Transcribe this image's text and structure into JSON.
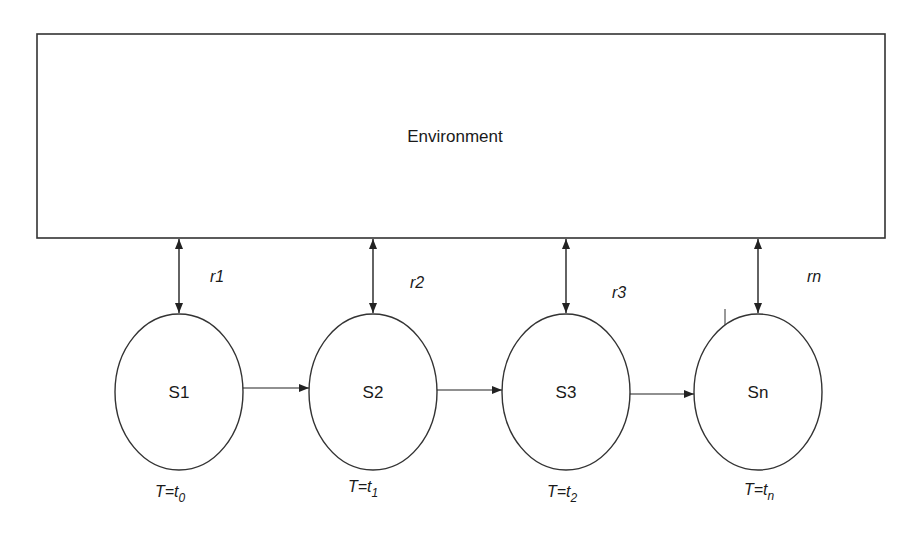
{
  "diagram": {
    "environment": {
      "label": "Environment",
      "x": 37,
      "y": 34,
      "w": 848,
      "h": 204
    },
    "stroke_color": "#333333",
    "states": [
      {
        "id": "S1",
        "label": "S1",
        "cx": 179,
        "cy": 392,
        "rx": 64,
        "ry": 78,
        "reward": "r1",
        "time_prefix": "T=t",
        "time_sub": "0",
        "reward_x": 210,
        "reward_y": 282,
        "time_x": 155,
        "time_y": 497
      },
      {
        "id": "S2",
        "label": "S2",
        "cx": 373,
        "cy": 392,
        "rx": 64,
        "ry": 78,
        "reward": "r2",
        "time_prefix": "T=t",
        "time_sub": "1",
        "reward_x": 410,
        "reward_y": 288,
        "time_x": 348,
        "time_y": 492
      },
      {
        "id": "S3",
        "label": "S3",
        "cx": 566,
        "cy": 392,
        "rx": 64,
        "ry": 78,
        "reward": "r3",
        "time_prefix": "T=t",
        "time_sub": "2",
        "reward_x": 612,
        "reward_y": 298,
        "time_x": 547,
        "time_y": 497
      },
      {
        "id": "Sn",
        "label": "Sn",
        "cx": 758,
        "cy": 392,
        "rx": 64,
        "ry": 78,
        "reward": "rn",
        "time_prefix": "T=t",
        "time_sub": "n",
        "reward_x": 807,
        "reward_y": 282,
        "time_x": 744,
        "time_y": 495
      }
    ],
    "transitions": [
      {
        "from": "S1",
        "to": "S2",
        "y": 388
      },
      {
        "from": "S2",
        "to": "S3",
        "y": 390
      },
      {
        "from": "S3",
        "to": "Sn",
        "y": 394
      }
    ]
  }
}
